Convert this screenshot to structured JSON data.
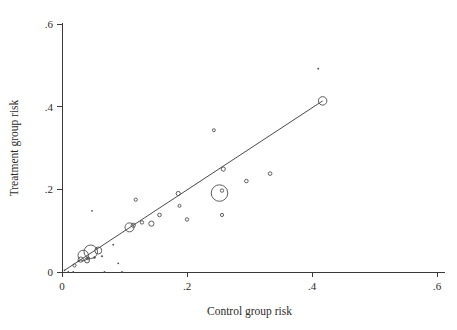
{
  "chart_data": {
    "type": "scatter",
    "title": "",
    "xlabel": "Control group risk",
    "ylabel": "Treatment group risk",
    "xlim": [
      0,
      0.6
    ],
    "ylim": [
      0,
      0.6
    ],
    "xticks": [
      0,
      0.2,
      0.4,
      0.6
    ],
    "xtick_labels": [
      "0",
      ".2",
      ".4",
      ".6"
    ],
    "yticks": [
      0,
      0.2,
      0.4,
      0.6
    ],
    "ytick_labels": [
      "0",
      ".2",
      ".4",
      ".6"
    ],
    "grid": false,
    "legend": "none",
    "marker_style": "open-circle-weighted",
    "size_encodes": "study weight",
    "points": [
      {
        "x": 0.004,
        "y": 0.004,
        "size": 1.4
      },
      {
        "x": 0.01,
        "y": 0.0,
        "size": 1.4
      },
      {
        "x": 0.018,
        "y": 0.0,
        "size": 1.4
      },
      {
        "x": 0.02,
        "y": 0.016,
        "size": 3.2
      },
      {
        "x": 0.026,
        "y": 0.026,
        "size": 1.6
      },
      {
        "x": 0.03,
        "y": 0.03,
        "size": 5.2
      },
      {
        "x": 0.034,
        "y": 0.04,
        "size": 10.5
      },
      {
        "x": 0.04,
        "y": 0.028,
        "size": 5.0
      },
      {
        "x": 0.042,
        "y": 0.033,
        "size": 3.0
      },
      {
        "x": 0.046,
        "y": 0.049,
        "size": 13.5
      },
      {
        "x": 0.048,
        "y": 0.148,
        "size": 1.8
      },
      {
        "x": 0.052,
        "y": 0.035,
        "size": 2.4
      },
      {
        "x": 0.058,
        "y": 0.052,
        "size": 7.0
      },
      {
        "x": 0.064,
        "y": 0.038,
        "size": 2.0
      },
      {
        "x": 0.068,
        "y": 0.0,
        "size": 1.4
      },
      {
        "x": 0.082,
        "y": 0.066,
        "size": 1.5
      },
      {
        "x": 0.09,
        "y": 0.021,
        "size": 1.5
      },
      {
        "x": 0.096,
        "y": 0.0,
        "size": 1.5
      },
      {
        "x": 0.108,
        "y": 0.108,
        "size": 9.0
      },
      {
        "x": 0.114,
        "y": 0.113,
        "size": 4.2
      },
      {
        "x": 0.118,
        "y": 0.175,
        "size": 3.2
      },
      {
        "x": 0.128,
        "y": 0.12,
        "size": 3.4
      },
      {
        "x": 0.143,
        "y": 0.117,
        "size": 5.2
      },
      {
        "x": 0.156,
        "y": 0.138,
        "size": 3.6
      },
      {
        "x": 0.186,
        "y": 0.19,
        "size": 4.2
      },
      {
        "x": 0.188,
        "y": 0.16,
        "size": 3.0
      },
      {
        "x": 0.2,
        "y": 0.127,
        "size": 3.4
      },
      {
        "x": 0.243,
        "y": 0.343,
        "size": 3.0
      },
      {
        "x": 0.252,
        "y": 0.191,
        "size": 16.5
      },
      {
        "x": 0.256,
        "y": 0.197,
        "size": 3.4
      },
      {
        "x": 0.258,
        "y": 0.249,
        "size": 4.2
      },
      {
        "x": 0.256,
        "y": 0.138,
        "size": 3.2
      },
      {
        "x": 0.295,
        "y": 0.22,
        "size": 3.6
      },
      {
        "x": 0.333,
        "y": 0.238,
        "size": 3.6
      },
      {
        "x": 0.41,
        "y": 0.492,
        "size": 1.6
      },
      {
        "x": 0.417,
        "y": 0.414,
        "size": 8.5
      }
    ],
    "fit_line": {
      "x_start": 0.004,
      "y_start": 0.004,
      "x_end": 0.417,
      "y_end": 0.414
    }
  },
  "geometry": {
    "plot_left_px": 62,
    "plot_right_px": 437,
    "plot_top_px": 24,
    "plot_bottom_px": 272
  },
  "colors": {
    "axis": "#3a3a3a",
    "marker": "#4d4d4d",
    "line": "#4a4a4a",
    "background": "#ffffff"
  }
}
